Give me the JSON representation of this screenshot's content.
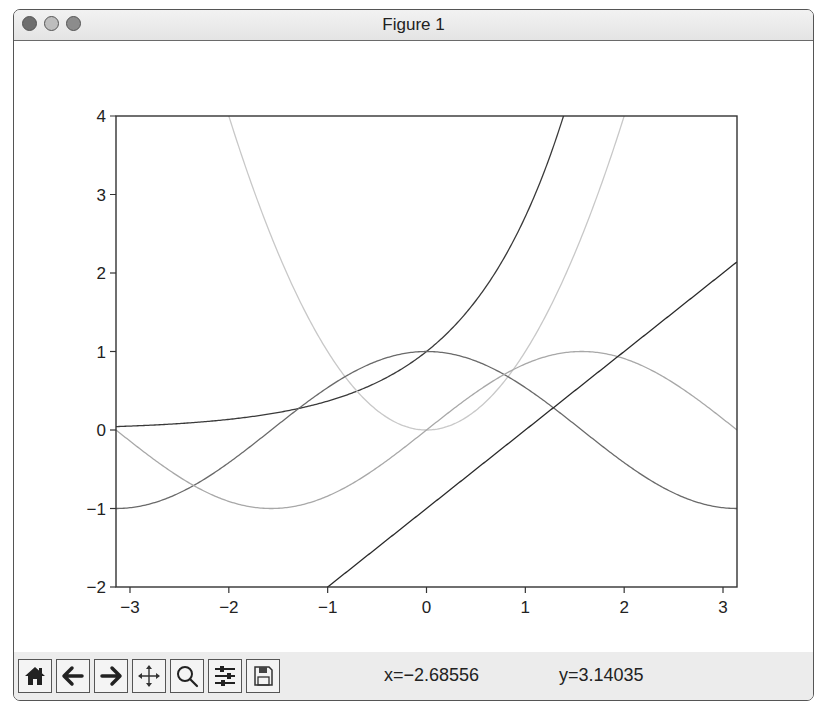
{
  "window": {
    "title": "Figure 1",
    "controls": [
      "close",
      "minimize",
      "maximize"
    ]
  },
  "toolbar": {
    "buttons": [
      {
        "name": "home",
        "icon": "home-icon",
        "label": "Home"
      },
      {
        "name": "back",
        "icon": "arrow-left-icon",
        "label": "Back"
      },
      {
        "name": "forward",
        "icon": "arrow-right-icon",
        "label": "Forward"
      },
      {
        "name": "pan",
        "icon": "move-icon",
        "label": "Pan"
      },
      {
        "name": "zoom",
        "icon": "magnifier-icon",
        "label": "Zoom"
      },
      {
        "name": "subplots",
        "icon": "sliders-icon",
        "label": "Configure subplots"
      },
      {
        "name": "save",
        "icon": "floppy-disk-icon",
        "label": "Save"
      }
    ],
    "coords": {
      "x": "x=−2.68556",
      "y": "y=3.14035"
    }
  },
  "chart_data": {
    "type": "line",
    "title": "",
    "xlabel": "",
    "ylabel": "",
    "xlim": [
      -3.14159,
      3.14159
    ],
    "ylim": [
      -2,
      4
    ],
    "grid": false,
    "legend": null,
    "x_ticks": [
      "−3",
      "−2",
      "−1",
      "0",
      "1",
      "2",
      "3"
    ],
    "y_ticks": [
      "−2",
      "−1",
      "0",
      "1",
      "2",
      "3",
      "4"
    ],
    "series": [
      {
        "name": "exp(x)",
        "formula": "exp(x)",
        "color": "#3a3a3a"
      },
      {
        "name": "x^2",
        "formula": "x*x",
        "color": "#c8c8c8"
      },
      {
        "name": "cos(x)",
        "formula": "cos(x)",
        "color": "#6a6a6a"
      },
      {
        "name": "sin(x)",
        "formula": "sin(x)",
        "color": "#a8a8a8"
      },
      {
        "name": "x-1",
        "formula": "x-1",
        "color": "#2a2a2a"
      }
    ],
    "sample_points": {
      "x": [
        -3.14,
        -2,
        -1,
        0,
        1,
        2,
        3.14
      ],
      "exp(x)": [
        0.04,
        0.14,
        0.37,
        1.0,
        2.72,
        7.39,
        23.1
      ],
      "x^2": [
        9.86,
        4.0,
        1.0,
        0.0,
        1.0,
        4.0,
        9.86
      ],
      "cos(x)": [
        -1.0,
        -0.42,
        0.54,
        1.0,
        0.54,
        -0.42,
        -1.0
      ],
      "sin(x)": [
        0.0,
        -0.91,
        -0.84,
        0.0,
        0.84,
        0.91,
        0.0
      ],
      "x-1": [
        -4.14,
        -3.0,
        -2.0,
        -1.0,
        0.0,
        1.0,
        2.14
      ]
    }
  }
}
